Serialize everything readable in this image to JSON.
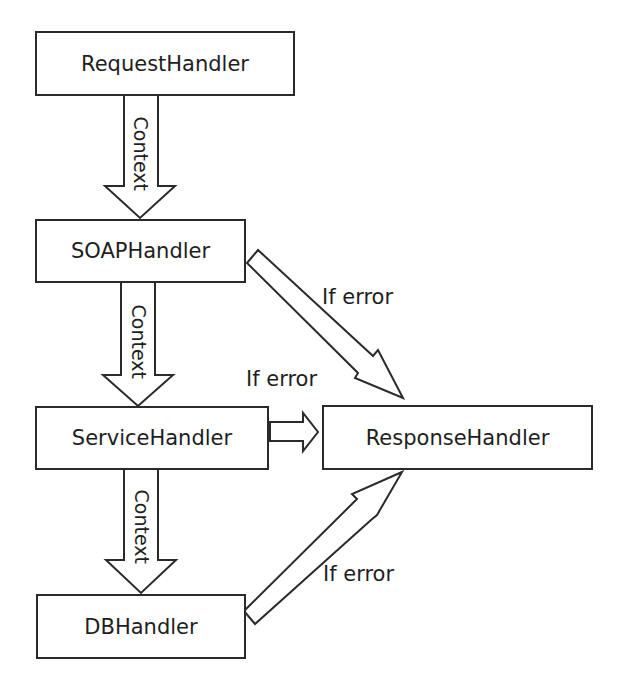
{
  "diagram": {
    "nodes": [
      {
        "id": "request",
        "label": "RequestHandler"
      },
      {
        "id": "soap",
        "label": "SOAPHandler"
      },
      {
        "id": "service",
        "label": "ServiceHandler"
      },
      {
        "id": "response",
        "label": "ResponseHandler"
      },
      {
        "id": "db",
        "label": "DBHandler"
      }
    ],
    "edges": [
      {
        "from": "request",
        "to": "soap",
        "label": "Context"
      },
      {
        "from": "soap",
        "to": "service",
        "label": "Context"
      },
      {
        "from": "service",
        "to": "db",
        "label": "Context"
      },
      {
        "from": "soap",
        "to": "response",
        "label": "If error"
      },
      {
        "from": "service",
        "to": "response",
        "label": "If error"
      },
      {
        "from": "db",
        "to": "response",
        "label": "If error"
      }
    ],
    "colors": {
      "stroke": "#2a2a2a",
      "fill": "#ffffff",
      "text": "#1e1e1e"
    }
  }
}
